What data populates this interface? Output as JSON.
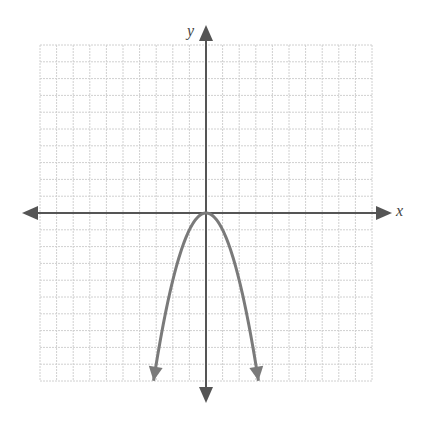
{
  "chart_data": {
    "type": "line",
    "title": "",
    "xlabel": "x",
    "ylabel": "y",
    "xlim": [
      -10,
      10
    ],
    "ylim": [
      -10,
      10
    ],
    "grid": true,
    "grid_step": 1,
    "tick_labels_shown": false,
    "series": [
      {
        "name": "y = -x^2",
        "equation": "y = -x^2",
        "vertex": [
          0,
          0
        ],
        "opens": "down",
        "arrows_at_ends": true,
        "x": [
          -3.16,
          -3,
          -2.5,
          -2,
          -1.5,
          -1,
          -0.5,
          0,
          0.5,
          1,
          1.5,
          2,
          2.5,
          3,
          3.16
        ],
        "y": [
          -10,
          -9,
          -6.25,
          -4,
          -2.25,
          -1,
          -0.25,
          0,
          -0.25,
          -1,
          -2.25,
          -4,
          -6.25,
          -9,
          -10
        ]
      }
    ]
  },
  "axes": {
    "x_label": "x",
    "y_label": "y"
  },
  "colors": {
    "grid": "#d0d0d0",
    "axis": "#555555",
    "curve": "#7a7a7a"
  }
}
